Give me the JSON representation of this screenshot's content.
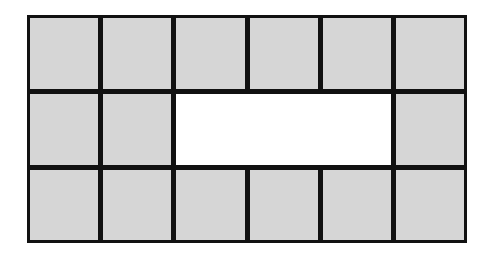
{
  "diagram": {
    "type": "grid-of-tiles",
    "columns": 6,
    "rows": 3,
    "tile_color": "#d6d6d6",
    "border_color": "#111111",
    "hole_color": "#ffffff",
    "hole": {
      "row": 1,
      "col_start": 2,
      "col_end": 5
    },
    "cells": [
      {
        "row": 0,
        "col": 0,
        "filled": true
      },
      {
        "row": 0,
        "col": 1,
        "filled": true
      },
      {
        "row": 0,
        "col": 2,
        "filled": true
      },
      {
        "row": 0,
        "col": 3,
        "filled": true
      },
      {
        "row": 0,
        "col": 4,
        "filled": true
      },
      {
        "row": 0,
        "col": 5,
        "filled": true
      },
      {
        "row": 1,
        "col": 0,
        "filled": true
      },
      {
        "row": 1,
        "col": 1,
        "filled": true
      },
      {
        "row": 1,
        "col": 5,
        "filled": true
      },
      {
        "row": 2,
        "col": 0,
        "filled": true
      },
      {
        "row": 2,
        "col": 1,
        "filled": true
      },
      {
        "row": 2,
        "col": 2,
        "filled": true
      },
      {
        "row": 2,
        "col": 3,
        "filled": true
      },
      {
        "row": 2,
        "col": 4,
        "filled": true
      },
      {
        "row": 2,
        "col": 5,
        "filled": true
      }
    ],
    "filled_count": 14,
    "hole_cells": 4
  }
}
